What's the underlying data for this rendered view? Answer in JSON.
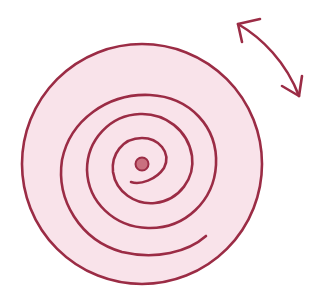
{
  "illustration": {
    "description": "Hand-drawn spiral inside a pink circle with a curved double-headed rotation arrow",
    "colors": {
      "stroke": "#9b2c45",
      "circle_fill": "#f9e3ea",
      "center_dot": "#c9707f",
      "background": "#ffffff"
    },
    "icons": {
      "spiral": "spiral-icon",
      "arrow": "double-headed-rotate-arrow-icon",
      "center": "center-dot-icon"
    }
  }
}
